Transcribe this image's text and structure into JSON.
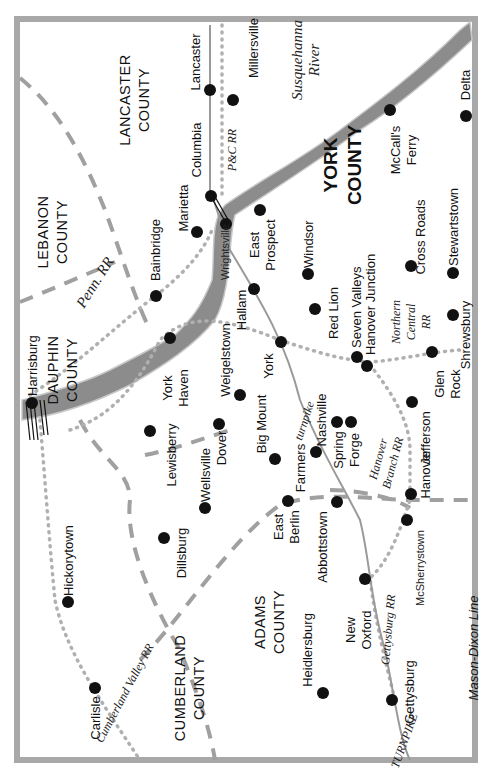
{
  "map": {
    "orientation": "rotated 90deg counter-clockwise",
    "colors": {
      "border": "#a8a8a8",
      "river": "#8c8c8c",
      "river_dark": "#6f6f6f",
      "county_line": "#a0a0a0",
      "railroad": "#b0b0b0",
      "turnpike": "#9a9a9a",
      "town_dot": "#111111"
    },
    "counties": [
      {
        "id": "lancaster",
        "line1": "LANCASTER",
        "line2": "COUNTY"
      },
      {
        "id": "lebanon",
        "line1": "LEBANON",
        "line2": "COUNTY"
      },
      {
        "id": "dauphin",
        "line1": "DAUPHIN",
        "line2": "COUNTY"
      },
      {
        "id": "york",
        "line1": "YORK",
        "line2": "COUNTY"
      },
      {
        "id": "adams",
        "line1": "ADAMS",
        "line2": "COUNTY"
      },
      {
        "id": "cumberland",
        "line1": "CUMBERLAND",
        "line2": "COUNTY"
      }
    ],
    "towns": {
      "lancaster": "Lancaster",
      "millersville": "Millersville",
      "columbia": "Columbia",
      "marietta": "Marietta",
      "bainbridge": "Bainbridge",
      "harrisburg": "Harrisburg",
      "york_haven_1": "York",
      "york_haven_2": "Haven",
      "lewisberry": "Lewisberry",
      "wellsville": "Wellsville",
      "dover": "Dover",
      "weigelstown": "Weigelstown",
      "dillsburg": "Dillsburg",
      "hickorytown": "Hickorytown",
      "carlisle": "Carlisle",
      "wrightsville": "Wrightsville",
      "hallam": "Hallam",
      "york": "York",
      "east_prospect_1": "East",
      "east_prospect_2": "Prospect",
      "windsor": "Windsor",
      "red_lion": "Red Lion",
      "seven_valleys": "Seven Valleys",
      "hanover_junction": "Hanover Junction",
      "cross_roads": "Cross Roads",
      "stewartstown": "Stewartstown",
      "shrewsbury": "Shrewsbury",
      "glen_rock_1": "Glen",
      "glen_rock_2": "Rock",
      "mccalls_ferry_1": "McCall's",
      "mccalls_ferry_2": "Ferry",
      "delta": "Delta",
      "big_mount": "Big Mount",
      "east_berlin_1": "East",
      "east_berlin_2": "Berlin",
      "farmers": "Farmers",
      "nashville": "Nashville",
      "spring_forge_1": "Spring",
      "spring_forge_2": "Forge",
      "abbottstown": "Abbottstown",
      "jefferson": "Jefferson",
      "hanover": "Hanover",
      "mcsherrystown": "McSherrystown",
      "new_oxford_1": "New",
      "new_oxford_2": "Oxford",
      "heidlersburg": "Heidlersburg",
      "gettysburg": "Gettysburg"
    },
    "features": {
      "river_1": "Susquehanna",
      "river_2": "River",
      "penn_rr": "Penn. RR",
      "pc_rr": "P&C RR",
      "northern_central_1": "Northern",
      "northern_central_2": "Central",
      "northern_central_3": "RR",
      "hanover_branch_1": "Hanover",
      "hanover_branch_2": "Branch RR",
      "turnpike_lower": "turnpike",
      "turnpike_upper": "TURNPIKE",
      "gettysburg_rr": "Gettysburg RR",
      "cumberland_valley_rr": "Cumberland Valley RR",
      "mason_dixon": "Mason-Dixon Line"
    }
  }
}
